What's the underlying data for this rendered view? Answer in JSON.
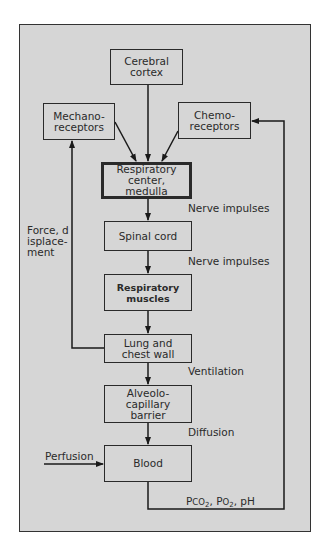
{
  "diagram": {
    "nodes": {
      "cerebral_cortex": "Cerebral cortex",
      "mechanoreceptors": "Mechano-receptors",
      "chemoreceptors": "Chemo-receptors",
      "respiratory_center": "Respiratory center, medulla",
      "spinal_cord": "Spinal cord",
      "respiratory_muscles": "Respiratory muscles",
      "lung_chest_wall": "Lung and chest wall",
      "alveolo_capillary": "Alveolo-capillary barrier",
      "blood": "Blood"
    },
    "edge_labels": {
      "nerve_impulses_1": "Nerve impulses",
      "nerve_impulses_2": "Nerve impulses",
      "ventilation": "Ventilation",
      "diffusion": "Diffusion",
      "force_displacement": "Force, displace-ment",
      "perfusion": "Perfusion",
      "blood_gases_prefix_pco": "P",
      "blood_gases_co": "CO",
      "blood_gases_sub": "2",
      "blood_gases_po": "P",
      "blood_gases_o": "O",
      "blood_gases_sub2": "2",
      "blood_gases_ph": "pH"
    },
    "edges": [
      {
        "from": "Cerebral cortex",
        "to": "Respiratory center, medulla"
      },
      {
        "from": "Mechano-receptors",
        "to": "Respiratory center, medulla"
      },
      {
        "from": "Chemo-receptors",
        "to": "Respiratory center, medulla"
      },
      {
        "from": "Respiratory center, medulla",
        "to": "Spinal cord",
        "label": "Nerve impulses"
      },
      {
        "from": "Spinal cord",
        "to": "Respiratory muscles",
        "label": "Nerve impulses"
      },
      {
        "from": "Respiratory muscles",
        "to": "Lung and chest wall"
      },
      {
        "from": "Lung and chest wall",
        "to": "Alveolo-capillary barrier",
        "label": "Ventilation"
      },
      {
        "from": "Alveolo-capillary barrier",
        "to": "Blood",
        "label": "Diffusion"
      },
      {
        "from": "Lung and chest wall",
        "to": "Mechano-receptors",
        "label": "Force, displacement"
      },
      {
        "from": "Blood",
        "to": "Chemo-receptors",
        "label": "Pco2, Po2, pH"
      },
      {
        "from": "external",
        "to": "Blood",
        "label": "Perfusion"
      }
    ]
  }
}
